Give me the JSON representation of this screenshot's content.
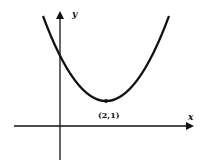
{
  "diagram": {
    "type": "parabola-graph",
    "axes": {
      "x_label": "x",
      "y_label": "y"
    },
    "vertex": {
      "label": "(2,1)",
      "x": 2,
      "y": 1
    },
    "curve": "upward-opening parabola with vertex at (2,1)",
    "colors": {
      "ink": "#111111",
      "background": "#ffffff"
    }
  }
}
